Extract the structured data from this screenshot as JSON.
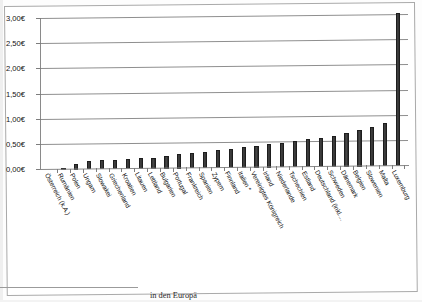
{
  "chart_data": {
    "type": "bar",
    "title": "",
    "xlabel": "",
    "ylabel": "",
    "ylim": [
      0,
      3.0
    ],
    "ytick_values": [
      0,
      0.5,
      1.0,
      1.5,
      2.0,
      2.5,
      3.0
    ],
    "ytick_labels": [
      "0,00€",
      "0,50€",
      "1,00€",
      "1,50€",
      "2,00€",
      "2,50€",
      "3,00€"
    ],
    "grid": true,
    "legend": "none",
    "currency_symbol": "€",
    "decimal_separator": ",",
    "categories": [
      "Österreich (k.A.)",
      "Rumänien",
      "Polen",
      "Ungarn",
      "Slowakei",
      "Griechenland",
      "Kroatien",
      "Litauen",
      "Lettland",
      "Bulgarien",
      "Portugal",
      "Frankreich",
      "Spanien",
      "Zypern",
      "Finnland",
      "Italien *",
      "Vereinigtes Königreich",
      "Irland",
      "Niederlande",
      "Tschechien",
      "Estland",
      "Deutschland (inkl....",
      "Schweden",
      "Dänemark",
      "Belgien",
      "Slowenien",
      "Malta",
      "Luxemburg"
    ],
    "values": [
      0.0,
      0.04,
      0.11,
      0.17,
      0.18,
      0.19,
      0.2,
      0.21,
      0.22,
      0.26,
      0.28,
      0.3,
      0.33,
      0.36,
      0.38,
      0.41,
      0.44,
      0.46,
      0.49,
      0.52,
      0.55,
      0.58,
      0.62,
      0.66,
      0.72,
      0.78,
      0.86,
      3.05
    ],
    "series": [
      {
        "name": "Preis",
        "values": [
          0.0,
          0.04,
          0.11,
          0.17,
          0.18,
          0.19,
          0.2,
          0.21,
          0.22,
          0.26,
          0.28,
          0.3,
          0.33,
          0.36,
          0.38,
          0.41,
          0.44,
          0.46,
          0.49,
          0.52,
          0.55,
          0.58,
          0.62,
          0.66,
          0.72,
          0.78,
          0.86,
          3.05
        ],
        "color": "#333333"
      }
    ],
    "notes": [
      "Österreich (k.A.) hat keinen Balken (keine Angabe)",
      "Italien ist mit * markiert"
    ]
  },
  "caption": {
    "text": "in den Europä"
  },
  "colors": {
    "bar": "#333333",
    "grid": "#8f8f8f",
    "axis": "#8a8a8a",
    "text": "#121212",
    "frame": "#a9a9a9"
  }
}
